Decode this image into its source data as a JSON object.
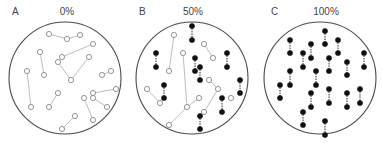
{
  "panels": [
    {
      "letter": "A",
      "percent": "0%",
      "letter_pos": [
        12,
        15
      ],
      "percent_pos": [
        67,
        15
      ],
      "circle": {
        "cx": 65,
        "cy": 78,
        "r": 56
      },
      "links": [
        {
          "type": "hollow",
          "x1": 49,
          "y1": 34,
          "x2": 67,
          "y2": 39
        },
        {
          "type": "hollow",
          "x1": 67,
          "y1": 39,
          "x2": 80,
          "y2": 35
        },
        {
          "type": "hollow",
          "x1": 93,
          "y1": 44,
          "x2": 62,
          "y2": 57
        },
        {
          "type": "hollow",
          "x1": 40,
          "y1": 52,
          "x2": 44,
          "y2": 75
        },
        {
          "type": "hollow",
          "x1": 58,
          "y1": 62,
          "x2": 71,
          "y2": 80
        },
        {
          "type": "hollow",
          "x1": 89,
          "y1": 57,
          "x2": 71,
          "y2": 80
        },
        {
          "type": "hollow",
          "x1": 27,
          "y1": 71,
          "x2": 31,
          "y2": 107
        },
        {
          "type": "hollow",
          "x1": 102,
          "y1": 75,
          "x2": 111,
          "y2": 71
        },
        {
          "type": "hollow",
          "x1": 58,
          "y1": 93,
          "x2": 49,
          "y2": 107
        },
        {
          "type": "hollow",
          "x1": 116,
          "y1": 89,
          "x2": 93,
          "y2": 93
        },
        {
          "type": "hollow",
          "x1": 84,
          "y1": 98,
          "x2": 93,
          "y2": 120
        },
        {
          "type": "hollow",
          "x1": 93,
          "y1": 98,
          "x2": 107,
          "y2": 107
        },
        {
          "type": "hollow",
          "x1": 75,
          "y1": 116,
          "x2": 62,
          "y2": 129
        }
      ],
      "dots": [
        {
          "type": "hollow",
          "x": 49,
          "y": 34
        },
        {
          "type": "hollow",
          "x": 67,
          "y": 39
        },
        {
          "type": "hollow",
          "x": 80,
          "y": 35
        },
        {
          "type": "hollow",
          "x": 93,
          "y": 44
        },
        {
          "type": "hollow",
          "x": 62,
          "y": 57
        },
        {
          "type": "hollow",
          "x": 40,
          "y": 52
        },
        {
          "type": "hollow",
          "x": 44,
          "y": 75
        },
        {
          "type": "hollow",
          "x": 58,
          "y": 62
        },
        {
          "type": "hollow",
          "x": 89,
          "y": 57
        },
        {
          "type": "hollow",
          "x": 71,
          "y": 80
        },
        {
          "type": "hollow",
          "x": 27,
          "y": 71
        },
        {
          "type": "hollow",
          "x": 31,
          "y": 107
        },
        {
          "type": "hollow",
          "x": 102,
          "y": 75
        },
        {
          "type": "hollow",
          "x": 111,
          "y": 71
        },
        {
          "type": "hollow",
          "x": 58,
          "y": 93
        },
        {
          "type": "hollow",
          "x": 49,
          "y": 107
        },
        {
          "type": "hollow",
          "x": 116,
          "y": 89
        },
        {
          "type": "hollow",
          "x": 93,
          "y": 93
        },
        {
          "type": "hollow",
          "x": 84,
          "y": 98
        },
        {
          "type": "hollow",
          "x": 93,
          "y": 120
        },
        {
          "type": "hollow",
          "x": 93,
          "y": 98
        },
        {
          "type": "hollow",
          "x": 107,
          "y": 107
        },
        {
          "type": "hollow",
          "x": 75,
          "y": 116
        },
        {
          "type": "hollow",
          "x": 62,
          "y": 129
        }
      ]
    },
    {
      "letter": "B",
      "percent": "50%",
      "letter_pos": [
        139,
        15
      ],
      "percent_pos": [
        193,
        15
      ],
      "circle": {
        "cx": 192,
        "cy": 78,
        "r": 56
      },
      "links": [
        {
          "type": "filled",
          "x1": 192,
          "y1": 26,
          "x2": 192,
          "y2": 40
        },
        {
          "type": "hollow",
          "x1": 174,
          "y1": 35,
          "x2": 169,
          "y2": 71
        },
        {
          "type": "hollow",
          "x1": 204,
          "y1": 44,
          "x2": 213,
          "y2": 58
        },
        {
          "type": "filled",
          "x1": 156,
          "y1": 53,
          "x2": 156,
          "y2": 67
        },
        {
          "type": "hollow",
          "x1": 183,
          "y1": 53,
          "x2": 187,
          "y2": 107
        },
        {
          "type": "filled",
          "x1": 195,
          "y1": 58,
          "x2": 195,
          "y2": 71
        },
        {
          "type": "filled",
          "x1": 200,
          "y1": 67,
          "x2": 200,
          "y2": 80
        },
        {
          "type": "filled",
          "x1": 227,
          "y1": 53,
          "x2": 227,
          "y2": 67
        },
        {
          "type": "hollow",
          "x1": 209,
          "y1": 80,
          "x2": 218,
          "y2": 89
        },
        {
          "type": "hollow",
          "x1": 218,
          "y1": 89,
          "x2": 204,
          "y2": 112
        },
        {
          "type": "filled",
          "x1": 240,
          "y1": 80,
          "x2": 240,
          "y2": 93
        },
        {
          "type": "hollow",
          "x1": 147,
          "y1": 89,
          "x2": 160,
          "y2": 103
        },
        {
          "type": "filled",
          "x1": 164,
          "y1": 85,
          "x2": 164,
          "y2": 98
        },
        {
          "type": "hollow",
          "x1": 199,
          "y1": 98,
          "x2": 187,
          "y2": 107
        },
        {
          "type": "hollow",
          "x1": 187,
          "y1": 107,
          "x2": 169,
          "y2": 125
        },
        {
          "type": "filled",
          "x1": 222,
          "y1": 98,
          "x2": 222,
          "y2": 112
        },
        {
          "type": "filled",
          "x1": 200,
          "y1": 116,
          "x2": 200,
          "y2": 129
        }
      ],
      "dots": [
        {
          "type": "filled",
          "x": 192,
          "y": 26
        },
        {
          "type": "filled",
          "x": 192,
          "y": 40
        },
        {
          "type": "hollow",
          "x": 174,
          "y": 35
        },
        {
          "type": "hollow",
          "x": 169,
          "y": 71
        },
        {
          "type": "hollow",
          "x": 204,
          "y": 44
        },
        {
          "type": "hollow",
          "x": 213,
          "y": 58
        },
        {
          "type": "filled",
          "x": 156,
          "y": 53
        },
        {
          "type": "filled",
          "x": 156,
          "y": 67
        },
        {
          "type": "hollow",
          "x": 183,
          "y": 53
        },
        {
          "type": "hollow",
          "x": 187,
          "y": 107
        },
        {
          "type": "filled",
          "x": 195,
          "y": 58
        },
        {
          "type": "filled",
          "x": 195,
          "y": 71
        },
        {
          "type": "filled",
          "x": 200,
          "y": 67
        },
        {
          "type": "filled",
          "x": 200,
          "y": 80
        },
        {
          "type": "filled",
          "x": 227,
          "y": 53
        },
        {
          "type": "filled",
          "x": 227,
          "y": 67
        },
        {
          "type": "hollow",
          "x": 209,
          "y": 80
        },
        {
          "type": "hollow",
          "x": 218,
          "y": 89
        },
        {
          "type": "hollow",
          "x": 204,
          "y": 112
        },
        {
          "type": "filled",
          "x": 240,
          "y": 80
        },
        {
          "type": "filled",
          "x": 240,
          "y": 93
        },
        {
          "type": "hollow",
          "x": 147,
          "y": 89
        },
        {
          "type": "hollow",
          "x": 160,
          "y": 103
        },
        {
          "type": "filled",
          "x": 164,
          "y": 85
        },
        {
          "type": "filled",
          "x": 164,
          "y": 98
        },
        {
          "type": "hollow",
          "x": 199,
          "y": 98
        },
        {
          "type": "hollow",
          "x": 169,
          "y": 125
        },
        {
          "type": "hollow",
          "x": 231,
          "y": 98
        },
        {
          "type": "filled",
          "x": 222,
          "y": 98
        },
        {
          "type": "filled",
          "x": 222,
          "y": 112
        },
        {
          "type": "filled",
          "x": 200,
          "y": 116
        },
        {
          "type": "filled",
          "x": 200,
          "y": 129
        }
      ]
    },
    {
      "letter": "C",
      "percent": "100%",
      "letter_pos": [
        271,
        15
      ],
      "percent_pos": [
        326,
        15
      ],
      "circle": {
        "cx": 320,
        "cy": 78,
        "r": 56
      },
      "links": [
        {
          "type": "filled",
          "x1": 290,
          "y1": 40,
          "x2": 290,
          "y2": 53
        },
        {
          "type": "filled",
          "x1": 325,
          "y1": 31,
          "x2": 325,
          "y2": 44
        },
        {
          "type": "filled",
          "x1": 311,
          "y1": 44,
          "x2": 311,
          "y2": 58
        },
        {
          "type": "filled",
          "x1": 338,
          "y1": 40,
          "x2": 338,
          "y2": 53
        },
        {
          "type": "filled",
          "x1": 303,
          "y1": 53,
          "x2": 303,
          "y2": 67
        },
        {
          "type": "filled",
          "x1": 329,
          "y1": 58,
          "x2": 329,
          "y2": 71
        },
        {
          "type": "filled",
          "x1": 347,
          "y1": 62,
          "x2": 347,
          "y2": 75
        },
        {
          "type": "filled",
          "x1": 364,
          "y1": 53,
          "x2": 364,
          "y2": 67
        },
        {
          "type": "filled",
          "x1": 290,
          "y1": 71,
          "x2": 290,
          "y2": 85
        },
        {
          "type": "filled",
          "x1": 316,
          "y1": 71,
          "x2": 316,
          "y2": 85
        },
        {
          "type": "filled",
          "x1": 280,
          "y1": 85,
          "x2": 280,
          "y2": 98
        },
        {
          "type": "filled",
          "x1": 311,
          "y1": 93,
          "x2": 311,
          "y2": 107
        },
        {
          "type": "filled",
          "x1": 329,
          "y1": 89,
          "x2": 329,
          "y2": 103
        },
        {
          "type": "filled",
          "x1": 347,
          "y1": 93,
          "x2": 347,
          "y2": 107
        },
        {
          "type": "filled",
          "x1": 360,
          "y1": 89,
          "x2": 360,
          "y2": 103
        },
        {
          "type": "filled",
          "x1": 303,
          "y1": 112,
          "x2": 303,
          "y2": 125
        },
        {
          "type": "filled",
          "x1": 325,
          "y1": 121,
          "x2": 325,
          "y2": 135
        }
      ],
      "dots": [
        {
          "type": "filled",
          "x": 290,
          "y": 40
        },
        {
          "type": "filled",
          "x": 290,
          "y": 53
        },
        {
          "type": "filled",
          "x": 325,
          "y": 31
        },
        {
          "type": "filled",
          "x": 325,
          "y": 44
        },
        {
          "type": "filled",
          "x": 311,
          "y": 44
        },
        {
          "type": "filled",
          "x": 311,
          "y": 58
        },
        {
          "type": "filled",
          "x": 338,
          "y": 40
        },
        {
          "type": "filled",
          "x": 338,
          "y": 53
        },
        {
          "type": "filled",
          "x": 303,
          "y": 53
        },
        {
          "type": "filled",
          "x": 303,
          "y": 67
        },
        {
          "type": "filled",
          "x": 329,
          "y": 58
        },
        {
          "type": "filled",
          "x": 329,
          "y": 71
        },
        {
          "type": "filled",
          "x": 347,
          "y": 62
        },
        {
          "type": "filled",
          "x": 347,
          "y": 75
        },
        {
          "type": "filled",
          "x": 364,
          "y": 53
        },
        {
          "type": "filled",
          "x": 364,
          "y": 67
        },
        {
          "type": "filled",
          "x": 290,
          "y": 71
        },
        {
          "type": "filled",
          "x": 290,
          "y": 85
        },
        {
          "type": "filled",
          "x": 316,
          "y": 71
        },
        {
          "type": "filled",
          "x": 316,
          "y": 85
        },
        {
          "type": "filled",
          "x": 280,
          "y": 85
        },
        {
          "type": "filled",
          "x": 280,
          "y": 98
        },
        {
          "type": "filled",
          "x": 311,
          "y": 93
        },
        {
          "type": "filled",
          "x": 311,
          "y": 107
        },
        {
          "type": "filled",
          "x": 329,
          "y": 89
        },
        {
          "type": "filled",
          "x": 329,
          "y": 103
        },
        {
          "type": "filled",
          "x": 347,
          "y": 93
        },
        {
          "type": "filled",
          "x": 347,
          "y": 107
        },
        {
          "type": "filled",
          "x": 360,
          "y": 89
        },
        {
          "type": "filled",
          "x": 360,
          "y": 103
        },
        {
          "type": "filled",
          "x": 303,
          "y": 112
        },
        {
          "type": "filled",
          "x": 303,
          "y": 125
        },
        {
          "type": "filled",
          "x": 325,
          "y": 121
        },
        {
          "type": "filled",
          "x": 325,
          "y": 135
        }
      ]
    }
  ],
  "colors": {
    "boundary": "#4a4a4a",
    "hollow_dot_stroke": "#8a8a8a",
    "hollow_link": "#b5b5b5",
    "filled_dot": "#111111",
    "label_text": "#444444"
  },
  "dot_radius": 2.6
}
